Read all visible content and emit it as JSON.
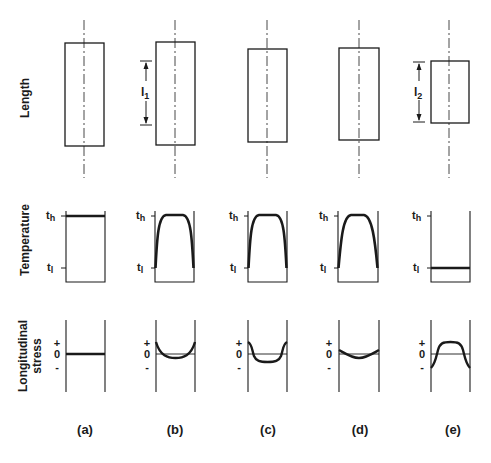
{
  "rows": {
    "length": "Length",
    "temperature": "Temperature",
    "stress_line1": "Longitudinal",
    "stress_line2": "stress"
  },
  "axis": {
    "t_high": "t",
    "t_high_sub": "h",
    "t_low": "t",
    "t_low_sub": "l",
    "plus": "+",
    "zero": "0",
    "minus": "-"
  },
  "dimensions": {
    "l1": "l",
    "l1_sub": "1",
    "l2": "l",
    "l2_sub": "2"
  },
  "columns": [
    {
      "label": "(a)"
    },
    {
      "label": "(b)"
    },
    {
      "label": "(c)"
    },
    {
      "label": "(d)"
    },
    {
      "label": "(e)"
    }
  ],
  "colors": {
    "ink": "#1a1a1a",
    "background": "#ffffff"
  }
}
